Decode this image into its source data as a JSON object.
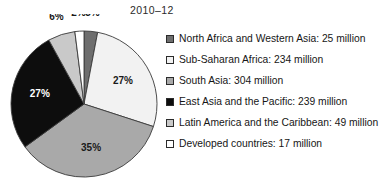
{
  "chart_data": {
    "type": "pie",
    "title": "2010–12",
    "xlabel": "",
    "ylabel": "",
    "unit": "million",
    "grid": false,
    "legend_position": "right",
    "start_angle_deg": 0,
    "direction": "clockwise",
    "categories": [
      "North Africa and Western Asia",
      "Sub-Saharan Africa",
      "South Asia",
      "East Asia and the Pacific",
      "Latin America and the Caribbean",
      "Developed countries"
    ],
    "values": [
      25,
      234,
      304,
      239,
      49,
      17
    ],
    "percent_labels": [
      "3%",
      "27%",
      "35%",
      "27%",
      "6%",
      "2%"
    ],
    "percents": [
      3,
      27,
      35,
      27,
      6,
      2
    ],
    "colors": [
      "#6e6e6e",
      "#f2f2f2",
      "#a9a9a9",
      "#0d0d0d",
      "#c9c9c9",
      "#ffffff"
    ],
    "slices": [
      {
        "label": "North Africa and Western Asia",
        "value": 25,
        "percent": 3,
        "percent_label": "3%",
        "color": "#6e6e6e",
        "label_placement": "outside",
        "label_fill": "dark"
      },
      {
        "label": "Sub-Saharan Africa",
        "value": 234,
        "percent": 27,
        "percent_label": "27%",
        "color": "#f2f2f2",
        "label_placement": "inside",
        "label_fill": "dark"
      },
      {
        "label": "South Asia",
        "value": 304,
        "percent": 35,
        "percent_label": "35%",
        "color": "#a9a9a9",
        "label_placement": "inside",
        "label_fill": "dark"
      },
      {
        "label": "East Asia and the Pacific",
        "value": 239,
        "percent": 27,
        "percent_label": "27%",
        "color": "#0d0d0d",
        "label_placement": "inside",
        "label_fill": "light"
      },
      {
        "label": "Latin America and the Caribbean",
        "value": 49,
        "percent": 6,
        "percent_label": "6%",
        "color": "#c9c9c9",
        "label_placement": "outside",
        "label_fill": "dark"
      },
      {
        "label": "Developed countries",
        "value": 17,
        "percent": 2,
        "percent_label": "2%",
        "color": "#ffffff",
        "label_placement": "outside",
        "label_fill": "dark"
      }
    ]
  },
  "legend": {
    "items": [
      {
        "text": "North Africa and Western Asia: 25 million",
        "color": "#6e6e6e"
      },
      {
        "text": "Sub-Saharan Africa: 234 million",
        "color": "#f2f2f2"
      },
      {
        "text": "South Asia: 304 million",
        "color": "#a9a9a9"
      },
      {
        "text": "East Asia and the Pacific: 239 million",
        "color": "#0d0d0d"
      },
      {
        "text": "Latin America and the Caribbean: 49 million",
        "color": "#c9c9c9"
      },
      {
        "text": "Developed countries: 17 million",
        "color": "#ffffff"
      }
    ]
  }
}
